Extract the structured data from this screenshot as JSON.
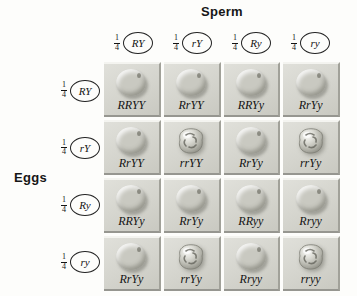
{
  "titles": {
    "sperm": "Sperm",
    "eggs": "Eggs"
  },
  "fraction": {
    "numerator": "1",
    "denominator": "4"
  },
  "sperm_gametes": [
    {
      "label": "RY"
    },
    {
      "label": "rY"
    },
    {
      "label": "Ry"
    },
    {
      "label": "ry"
    }
  ],
  "egg_gametes": [
    {
      "label": "RY"
    },
    {
      "label": "rY"
    },
    {
      "label": "Ry"
    },
    {
      "label": "ry"
    }
  ],
  "cells": [
    {
      "genotype": "RRYY",
      "pea": "round"
    },
    {
      "genotype": "RrYY",
      "pea": "round"
    },
    {
      "genotype": "RRYy",
      "pea": "round"
    },
    {
      "genotype": "RrYy",
      "pea": "round"
    },
    {
      "genotype": "RrYY",
      "pea": "round"
    },
    {
      "genotype": "rrYY",
      "pea": "wrinkled"
    },
    {
      "genotype": "RrYy",
      "pea": "round"
    },
    {
      "genotype": "rrYy",
      "pea": "wrinkled"
    },
    {
      "genotype": "RRYy",
      "pea": "round"
    },
    {
      "genotype": "RrYy",
      "pea": "round"
    },
    {
      "genotype": "RRyy",
      "pea": "round"
    },
    {
      "genotype": "Rryy",
      "pea": "round"
    },
    {
      "genotype": "RrYy",
      "pea": "round"
    },
    {
      "genotype": "rrYy",
      "pea": "wrinkled"
    },
    {
      "genotype": "Rryy",
      "pea": "round"
    },
    {
      "genotype": "rryy",
      "pea": "wrinkled"
    }
  ],
  "colors": {
    "background": "#fdfdfb",
    "tile_face": "#d4d4cd",
    "tile_highlight": "#f4f4f0",
    "tile_shadow": "#969690",
    "pea_base": "#c9c9c1",
    "text": "#141414"
  }
}
